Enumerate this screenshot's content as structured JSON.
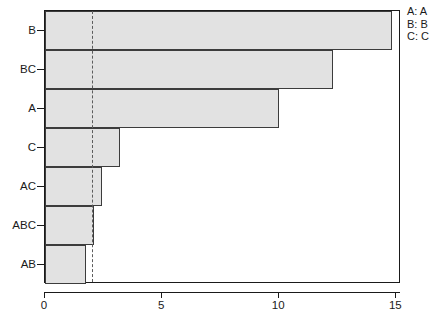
{
  "chart_data": {
    "type": "bar",
    "orientation": "horizontal",
    "title": "",
    "xlabel": "",
    "ylabel": "",
    "categories": [
      "B",
      "BC",
      "A",
      "C",
      "AC",
      "ABC",
      "AB"
    ],
    "values": [
      14.8,
      12.3,
      10.0,
      3.2,
      2.45,
      2.1,
      1.75
    ],
    "xlim": [
      0,
      15.2
    ],
    "xticks": [
      0,
      5,
      10,
      15
    ],
    "xtick_labels": [
      "0",
      "5",
      "10",
      "15"
    ],
    "ytick_labels": [
      "B",
      "BC",
      "A",
      "C",
      "AC",
      "ABC",
      "AB"
    ],
    "grid": false,
    "reference_line": {
      "value": 2.0,
      "style": "dashed",
      "color": "#5c5c5c"
    },
    "bar_fill_color": "#e2e2e2",
    "bar_border_color": "#3c3c3c",
    "axis_color": "#1a1a1a",
    "legend": {
      "position": "top-right",
      "entries": [
        {
          "key": "A",
          "label": "A: A"
        },
        {
          "key": "B",
          "label": "B: B"
        },
        {
          "key": "C",
          "label": "C: C"
        }
      ]
    }
  }
}
